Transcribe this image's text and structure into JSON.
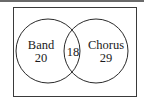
{
  "diagram": {
    "type": "venn",
    "sets": [
      {
        "name": "Band",
        "only_count": "20"
      },
      {
        "name": "Chorus",
        "only_count": "29"
      }
    ],
    "intersection_count": "18",
    "colors": {
      "stroke": "#2a2a2a",
      "background": "#ffffff",
      "topbar": "#6a6a6a"
    }
  }
}
